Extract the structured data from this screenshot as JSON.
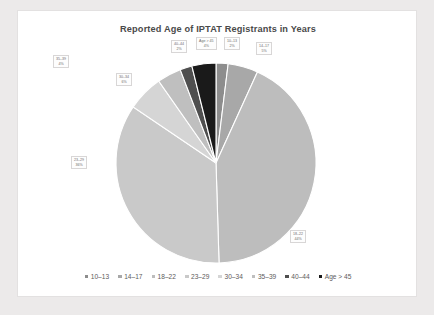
{
  "chart": {
    "title": "Reported Age of IPTAT Registrants in Years",
    "panel_background": "#ffffff",
    "page_background": "#eceaea"
  },
  "chart_data": {
    "type": "pie",
    "title": "Reported Age of IPTAT Registrants in Years",
    "xlabel": "",
    "ylabel": "",
    "legend_position": "bottom",
    "grid": false,
    "categories": [
      "10–13",
      "14–17",
      "18–22",
      "23–29",
      "30–34",
      "35–39",
      "40–44",
      "Age > 45"
    ],
    "values": [
      2,
      5,
      44,
      36,
      6,
      4,
      2,
      4
    ],
    "value_unit": "percent",
    "colors": [
      "#8d8d8d",
      "#a8a8a8",
      "#bdbdbd",
      "#c9c9c9",
      "#d5d5d5",
      "#bfbfbf",
      "#4f4f4f",
      "#1a1a1a"
    ],
    "slice_labels": [
      {
        "category": "10–13",
        "pct": "2%"
      },
      {
        "category": "14–17",
        "pct": "5%"
      },
      {
        "category": "18–22",
        "pct": "44%"
      },
      {
        "category": "23–29",
        "pct": "36%"
      },
      {
        "category": "30–34",
        "pct": "6%"
      },
      {
        "category": "35–39",
        "pct": "4%"
      },
      {
        "category": "40–44",
        "pct": "2%"
      },
      {
        "category": "Age > 45",
        "pct": "4%"
      }
    ]
  },
  "legend": {
    "items": [
      {
        "label": "10–13",
        "color": "#8d8d8d"
      },
      {
        "label": "14–17",
        "color": "#a8a8a8"
      },
      {
        "label": "18–22",
        "color": "#bdbdbd"
      },
      {
        "label": "23–29",
        "color": "#c9c9c9"
      },
      {
        "label": "30–34",
        "color": "#d5d5d5"
      },
      {
        "label": "35–39",
        "color": "#bfbfbf"
      },
      {
        "label": "40–44",
        "color": "#4f4f4f"
      },
      {
        "label": "Age > 45",
        "color": "#1a1a1a"
      }
    ]
  }
}
